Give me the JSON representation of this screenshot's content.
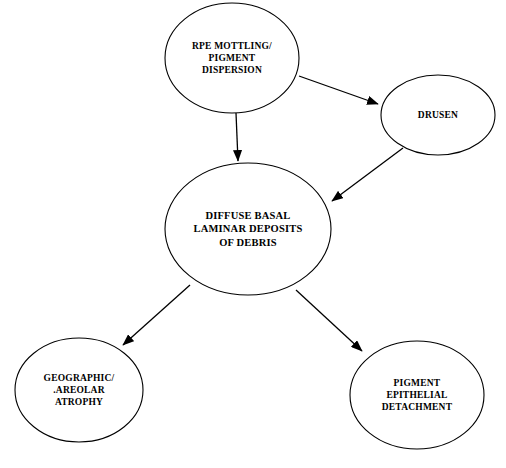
{
  "diagram": {
    "type": "flowchart",
    "background_color": "#ffffff",
    "stroke_color": "#000000",
    "nodes": [
      {
        "id": "rpe",
        "label": "RPE MOTTLING/\nPIGMENT\nDISPERSION",
        "shape": "ellipse",
        "cx": 232,
        "cy": 58,
        "rx": 67,
        "ry": 55
      },
      {
        "id": "drusen",
        "label": "DRUSEN",
        "shape": "ellipse",
        "cx": 438,
        "cy": 115,
        "rx": 57,
        "ry": 40
      },
      {
        "id": "diffuse",
        "label": "DIFFUSE  BASAL\nLAMINAR DEPOSITS\nOF DEBRIS",
        "shape": "ellipse",
        "cx": 248,
        "cy": 229,
        "rx": 83,
        "ry": 66
      },
      {
        "id": "geographic",
        "label": "GEOGRAPHIC/\n.AREOLAR\nATROPHY",
        "shape": "ellipse",
        "cx": 79,
        "cy": 390,
        "rx": 64,
        "ry": 52
      },
      {
        "id": "pigment",
        "label": "PIGMENT\nEPITHELIAL\nDETACHMENT",
        "shape": "ellipse",
        "cx": 417,
        "cy": 395,
        "rx": 67,
        "ry": 54
      }
    ],
    "edges": [
      {
        "id": "rpe-to-drusen",
        "from": "rpe",
        "to": "drusen",
        "x1": 299,
        "y1": 76,
        "x2": 378,
        "y2": 104
      },
      {
        "id": "rpe-to-diffuse",
        "from": "rpe",
        "to": "diffuse",
        "x1": 236,
        "y1": 113,
        "x2": 238,
        "y2": 161
      },
      {
        "id": "drusen-to-diffuse",
        "from": "drusen",
        "to": "diffuse",
        "x1": 403,
        "y1": 148,
        "x2": 332,
        "y2": 201
      },
      {
        "id": "diffuse-to-geographic",
        "from": "diffuse",
        "to": "geographic",
        "x1": 190,
        "y1": 285,
        "x2": 123,
        "y2": 345
      },
      {
        "id": "diffuse-to-pigment",
        "from": "diffuse",
        "to": "pigment",
        "x1": 296,
        "y1": 290,
        "x2": 362,
        "y2": 351
      }
    ]
  }
}
